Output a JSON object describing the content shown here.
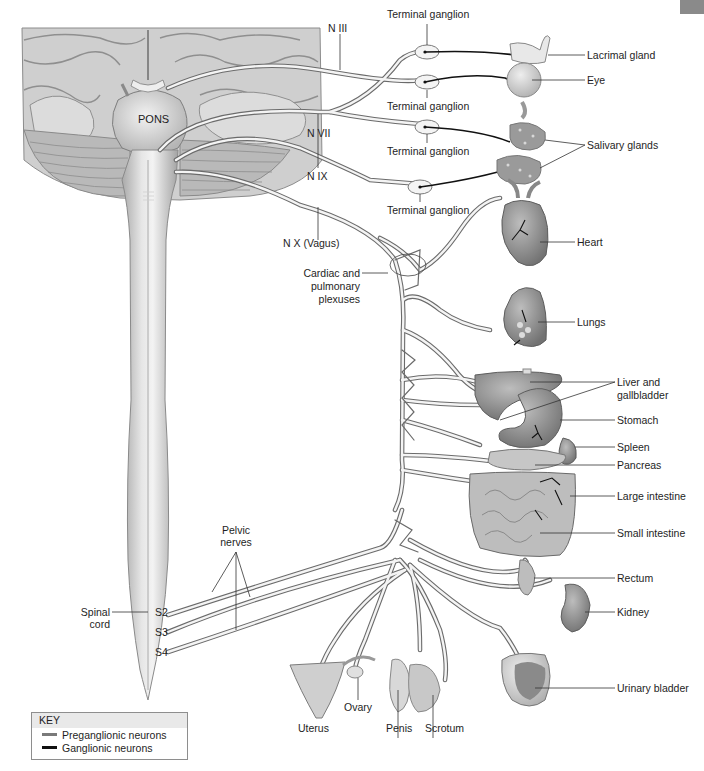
{
  "figure": {
    "type": "anatomical-diagram"
  },
  "colors": {
    "nerve_fill": "#f4f4f4",
    "nerve_outline": "#6b6b6b",
    "preganglionic": "#7a7a7a",
    "ganglionic": "#111111",
    "brain": "#c9c9c9",
    "organ": "#9a9a9a",
    "key_header": "#e9e9e9",
    "corner_tab": "#8a8a8a"
  },
  "structures": {
    "pons": "PONS",
    "spinal_cord": "Spinal\ncord",
    "spinal_cord_line1": "Spinal",
    "spinal_cord_line2": "cord",
    "sacral_segments": [
      "S2",
      "S3",
      "S4"
    ]
  },
  "cranial_nerves": [
    {
      "id": "n3",
      "label": "N III"
    },
    {
      "id": "n7",
      "label": "N VII"
    },
    {
      "id": "n9",
      "label": "N IX"
    },
    {
      "id": "n10",
      "label": "N X (Vagus)"
    }
  ],
  "ganglia": [
    {
      "label": "Terminal ganglion"
    },
    {
      "label": "Terminal ganglion"
    },
    {
      "label": "Terminal ganglion"
    },
    {
      "label": "Terminal ganglion"
    }
  ],
  "plexus": {
    "line1": "Cardiac and",
    "line2": "pulmonary",
    "line3": "plexuses"
  },
  "pelvic": {
    "line1": "Pelvic",
    "line2": "nerves"
  },
  "organs": [
    {
      "id": "lacrimal",
      "label": "Lacrimal gland"
    },
    {
      "id": "eye",
      "label": "Eye"
    },
    {
      "id": "salivary",
      "label": "Salivary glands"
    },
    {
      "id": "heart",
      "label": "Heart"
    },
    {
      "id": "lungs",
      "label": "Lungs"
    },
    {
      "id": "liver",
      "label": "Liver and\ngallbladder",
      "line1": "Liver and",
      "line2": "gallbladder"
    },
    {
      "id": "stomach",
      "label": "Stomach"
    },
    {
      "id": "spleen",
      "label": "Spleen"
    },
    {
      "id": "pancreas",
      "label": "Pancreas"
    },
    {
      "id": "large_intestine",
      "label": "Large intestine"
    },
    {
      "id": "small_intestine",
      "label": "Small intestine"
    },
    {
      "id": "rectum",
      "label": "Rectum"
    },
    {
      "id": "kidney",
      "label": "Kidney"
    },
    {
      "id": "bladder",
      "label": "Urinary bladder"
    },
    {
      "id": "uterus",
      "label": "Uterus"
    },
    {
      "id": "ovary",
      "label": "Ovary"
    },
    {
      "id": "penis",
      "label": "Penis"
    },
    {
      "id": "scrotum",
      "label": "Scrotum"
    }
  ],
  "key": {
    "title": "KEY",
    "items": [
      {
        "label": "Preganglionic neurons",
        "color": "#7a7a7a"
      },
      {
        "label": "Ganglionic neurons",
        "color": "#111111"
      }
    ]
  }
}
